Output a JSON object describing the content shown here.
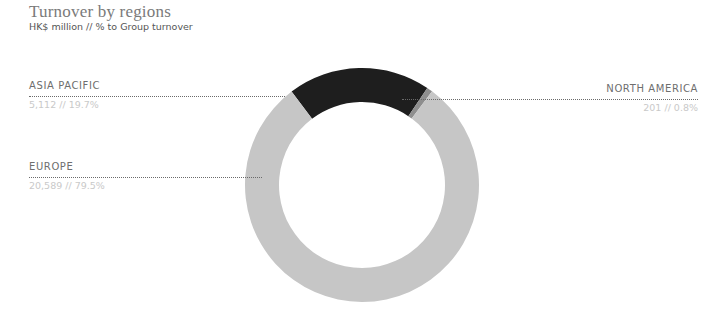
{
  "header": {
    "title": "Turnover by regions",
    "subtitle": "HK$ million // % to Group turnover"
  },
  "regions": [
    {
      "name": "ASIA PACIFIC",
      "value_text": "5,112 // 19.7%"
    },
    {
      "name": "EUROPE",
      "value_text": "20,589 // 79.5%"
    },
    {
      "name": "NORTH AMERICA",
      "value_text": "201 // 0.8%"
    }
  ],
  "colors": {
    "asia_pacific": "#1e1e1e",
    "europe": "#c6c6c6",
    "north_america": "#8e8e8e"
  },
  "chart_data": {
    "type": "pie",
    "title": "Turnover by regions",
    "subtitle": "HK$ million // % to Group turnover",
    "donut": true,
    "categories": [
      "Asia Pacific",
      "Europe",
      "North America"
    ],
    "values": [
      5112,
      20589,
      201
    ],
    "percentages": [
      19.7,
      79.5,
      0.8
    ],
    "unit": "HK$ million",
    "colors": [
      "#1e1e1e",
      "#c6c6c6",
      "#8e8e8e"
    ],
    "start_angle_deg": -37,
    "legend": "leader-line labels"
  }
}
